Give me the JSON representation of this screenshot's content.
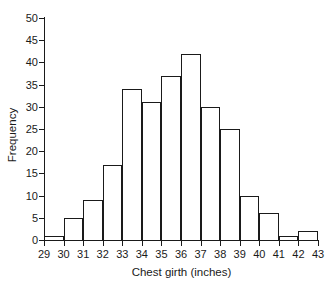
{
  "chart_data": {
    "type": "bar",
    "title": "",
    "subtitle": "",
    "xlabel": "Chest girth (inches)",
    "ylabel": "Frequency",
    "xlim": [
      29,
      43
    ],
    "ylim": [
      0,
      50
    ],
    "xticks": [
      29,
      30,
      31,
      32,
      33,
      34,
      35,
      36,
      37,
      38,
      39,
      40,
      41,
      42,
      43
    ],
    "yticks": [
      0,
      5,
      10,
      15,
      20,
      25,
      30,
      35,
      40,
      45,
      50
    ],
    "xtick_labels": [
      "29",
      "30",
      "31",
      "32",
      "33",
      "34",
      "35",
      "36",
      "37",
      "38",
      "39",
      "40",
      "41",
      "42",
      "43"
    ],
    "ytick_labels": [
      "0",
      "5",
      "10",
      "15",
      "20",
      "25",
      "30",
      "35",
      "40",
      "45",
      "50"
    ],
    "grid": false,
    "legend": false,
    "legend_position": "none",
    "bin_width": 1,
    "bin_edges": [
      29,
      30,
      31,
      32,
      33,
      34,
      35,
      36,
      37,
      38,
      39,
      40,
      41,
      42,
      43
    ],
    "categories": [
      "29-30",
      "30-31",
      "31-32",
      "32-33",
      "33-34",
      "34-35",
      "35-36",
      "36-37",
      "37-38",
      "38-39",
      "39-40",
      "40-41",
      "41-42",
      "42-43"
    ],
    "values": [
      1,
      5,
      9,
      17,
      34,
      31,
      37,
      42,
      30,
      25,
      10,
      6,
      1,
      2
    ],
    "bar_fill_color": "#ffffff",
    "bar_edge_color": "#1a1a1a",
    "axis_color": "#1a1a1a",
    "background_color": "#ffffff"
  }
}
